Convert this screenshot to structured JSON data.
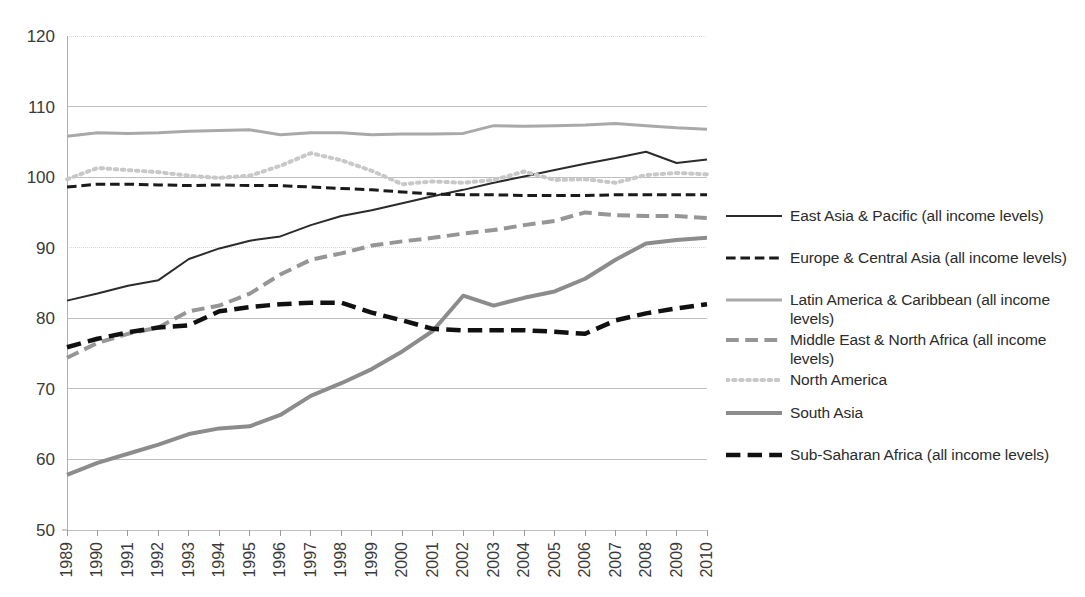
{
  "chart_data": {
    "type": "line",
    "title": "",
    "xlabel": "",
    "ylabel": "",
    "categories": [
      "1989",
      "1990",
      "1991",
      "1992",
      "1993",
      "1994",
      "1995",
      "1996",
      "1997",
      "1998",
      "1999",
      "2000",
      "2001",
      "2002",
      "2003",
      "2004",
      "2005",
      "2006",
      "2007",
      "2008",
      "2009",
      "2010"
    ],
    "xlim": [
      1989,
      2010
    ],
    "ylim": [
      50,
      120
    ],
    "yticks": [
      50,
      60,
      70,
      80,
      90,
      100,
      110,
      120
    ],
    "grid": true,
    "legend_position": "right",
    "series": [
      {
        "name": "East Asia & Pacific (all income levels)",
        "style": "solid",
        "color": "#2b2b2b",
        "width": 2,
        "values": [
          82.5,
          83.5,
          84.6,
          85.4,
          88.4,
          89.9,
          91.0,
          91.6,
          93.2,
          94.5,
          95.3,
          96.3,
          97.3,
          98.2,
          99.2,
          100.1,
          101.0,
          101.9,
          102.7,
          103.6,
          102.0,
          102.5
        ]
      },
      {
        "name": "Europe & Central Asia (all income levels)",
        "style": "dashed",
        "color": "#1a1a1a",
        "width": 3,
        "values": [
          98.6,
          99.0,
          99.0,
          98.9,
          98.8,
          98.9,
          98.8,
          98.8,
          98.6,
          98.4,
          98.2,
          97.9,
          97.6,
          97.5,
          97.5,
          97.4,
          97.4,
          97.4,
          97.5,
          97.5,
          97.5,
          97.5
        ]
      },
      {
        "name": "Latin America & Caribbean (all income levels)",
        "style": "solid",
        "color": "#a9a9a9",
        "width": 3,
        "values": [
          105.8,
          106.3,
          106.2,
          106.3,
          106.5,
          106.6,
          106.7,
          106.0,
          106.3,
          106.3,
          106.0,
          106.1,
          106.1,
          106.2,
          107.3,
          107.2,
          107.3,
          107.4,
          107.6,
          107.3,
          107.0,
          106.8
        ]
      },
      {
        "name": "Middle East & North Africa (all income levels)",
        "style": "dashed",
        "color": "#969696",
        "width": 4,
        "values": [
          74.4,
          76.5,
          77.8,
          78.7,
          81.0,
          81.8,
          83.5,
          86.2,
          88.3,
          89.2,
          90.3,
          90.9,
          91.4,
          92.0,
          92.5,
          93.2,
          93.8,
          95.0,
          94.6,
          94.5,
          94.5,
          94.2
        ]
      },
      {
        "name": "North America",
        "style": "dotted",
        "color": "#c8c8c8",
        "width": 4,
        "values": [
          99.7,
          101.3,
          101.0,
          100.7,
          100.2,
          99.9,
          100.2,
          101.6,
          103.4,
          102.4,
          100.9,
          99.0,
          99.4,
          99.2,
          99.6,
          100.8,
          99.6,
          99.7,
          99.2,
          100.3,
          100.6,
          100.4
        ]
      },
      {
        "name": "South Asia",
        "style": "solid",
        "color": "#8c8c8c",
        "width": 4,
        "values": [
          57.8,
          59.5,
          60.8,
          62.1,
          63.6,
          64.4,
          64.7,
          66.3,
          69.0,
          70.8,
          72.8,
          75.3,
          78.2,
          83.2,
          81.8,
          82.9,
          83.8,
          85.6,
          88.3,
          90.6,
          91.1,
          91.4
        ]
      },
      {
        "name": "Sub-Saharan Africa (all income levels)",
        "style": "dashed",
        "color": "#111111",
        "width": 4.5,
        "values": [
          75.9,
          77.1,
          78.0,
          78.7,
          79.0,
          81.0,
          81.6,
          82.0,
          82.2,
          82.2,
          80.8,
          79.7,
          78.5,
          78.3,
          78.3,
          78.3,
          78.1,
          77.8,
          79.7,
          80.7,
          81.4,
          82.0
        ]
      }
    ]
  },
  "legend": {
    "items": [
      {
        "label": "East Asia & Pacific (all income levels)"
      },
      {
        "label": "Europe & Central Asia (all income levels)"
      },
      {
        "label": "Latin America & Caribbean (all income levels)"
      },
      {
        "label": "Middle East & North Africa (all income levels)"
      },
      {
        "label": "North America"
      },
      {
        "label": "South Asia"
      },
      {
        "label": "Sub-Saharan Africa (all income levels)"
      }
    ]
  },
  "axes": {
    "y_tick_labels": [
      "120",
      "110",
      "100",
      "90",
      "80",
      "70",
      "60",
      "50"
    ],
    "x_tick_labels": [
      "1989",
      "1990",
      "1991",
      "1992",
      "1993",
      "1994",
      "1995",
      "1996",
      "1997",
      "1998",
      "1999",
      "2000",
      "2001",
      "2002",
      "2003",
      "2004",
      "2005",
      "2006",
      "2007",
      "2008",
      "2009",
      "2010"
    ]
  }
}
